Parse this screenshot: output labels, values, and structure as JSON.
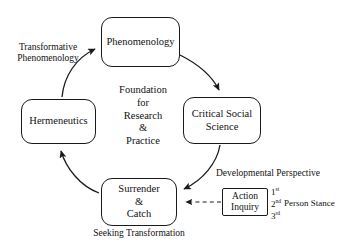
{
  "diagram": {
    "colors": {
      "stroke": "#1a1a1a",
      "background": "#ffffff",
      "text": "#111111"
    },
    "center": {
      "lines": [
        "Foundation",
        "for",
        "Research",
        "&",
        "Practice"
      ],
      "text": "Foundation\nfor\nResearch\n&\nPractice"
    },
    "nodes": [
      {
        "id": "phenomenology",
        "label": "Phenomenology",
        "shape": "rounded-rectangle"
      },
      {
        "id": "critical-social-science",
        "label": "Critical Social\nScience",
        "shape": "rounded-rectangle"
      },
      {
        "id": "surrender-and-catch",
        "label": "Surrender\n&\nCatch",
        "shape": "rounded-rectangle"
      },
      {
        "id": "hermeneutics",
        "label": "Hermeneutics",
        "shape": "rounded-rectangle"
      },
      {
        "id": "action-inquiry",
        "label": "Action\nInquiry",
        "shape": "rectangle"
      }
    ],
    "edge_labels": {
      "transformative": "Transformative\nPhenomenology",
      "seeking": "Seeking Transformation",
      "developmental": "Developmental Perspective"
    },
    "stance": {
      "ordinals": [
        "1st",
        "2nd",
        "3rd"
      ],
      "ordinal_parts": [
        {
          "number": "1",
          "suffix": "st"
        },
        {
          "number": "2",
          "suffix": "nd"
        },
        {
          "number": "3",
          "suffix": "rd"
        }
      ],
      "label": "Person Stance"
    },
    "arrows": [
      {
        "id": "hermeneutics-to-phenomenology",
        "from": "hermeneutics",
        "to": "phenomenology",
        "style": "solid-curved"
      },
      {
        "id": "phenomenology-to-critical",
        "from": "phenomenology",
        "to": "critical-social-science",
        "style": "solid-curved"
      },
      {
        "id": "critical-to-surrender",
        "from": "critical-social-science",
        "to": "surrender-and-catch",
        "style": "solid-curved"
      },
      {
        "id": "surrender-to-hermeneutics",
        "from": "surrender-and-catch",
        "to": "hermeneutics",
        "style": "solid-curved"
      },
      {
        "id": "action-inquiry-to-surrender",
        "from": "action-inquiry",
        "to": "surrender-and-catch",
        "style": "dashed-straight"
      }
    ]
  }
}
